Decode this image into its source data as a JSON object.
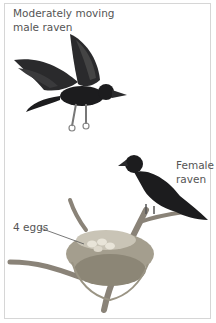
{
  "figure": {
    "labels": {
      "male_line1": "Moderately moving",
      "male_line2": "male raven",
      "female_line1": "Female",
      "female_line2": "raven",
      "eggs": "4 eggs"
    },
    "colors": {
      "label_text": "#555555",
      "border": "#d6d6d6",
      "raven": "#1c1c1e",
      "branch": "#8a8378",
      "nest": "#9a9484",
      "egg": "#e8e4d8"
    }
  }
}
